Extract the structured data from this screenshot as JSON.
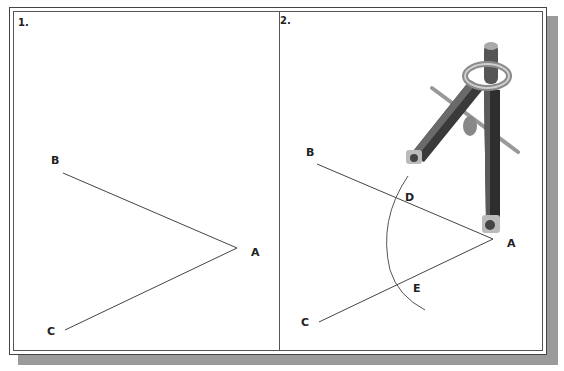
{
  "panels": [
    {
      "number": "1.",
      "points": {
        "A": "A",
        "B": "B",
        "C": "C"
      }
    },
    {
      "number": "2.",
      "points": {
        "A": "A",
        "B": "B",
        "C": "C",
        "D": "D",
        "E": "E"
      }
    }
  ]
}
